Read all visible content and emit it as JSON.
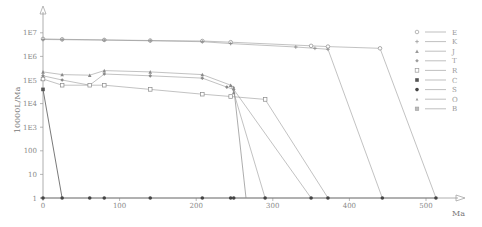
{
  "chart_data": {
    "type": "line",
    "title": "",
    "xlabel": "Ma",
    "ylabel": "10000L/Ma",
    "xscale": "linear",
    "yscale": "log",
    "xlim": [
      0,
      540
    ],
    "ylim": [
      1,
      20000000
    ],
    "x_ticks": [
      0,
      100,
      200,
      300,
      400,
      500
    ],
    "x_tick_labels": [
      "0",
      "100",
      "200",
      "300",
      "400",
      "500"
    ],
    "y_ticks": [
      1,
      10,
      100,
      1000,
      10000,
      100000,
      1000000,
      10000000
    ],
    "y_tick_labels": [
      "1",
      "10",
      "100",
      "1E3",
      "1E4",
      "1E5",
      "1E6",
      "1E7"
    ],
    "grid": false,
    "legend_position": "right",
    "series": [
      {
        "name": "E",
        "marker": "circle-open",
        "color": "#8a8a8a",
        "points": [
          [
            0,
            5500000
          ],
          [
            25,
            5300000
          ],
          [
            80,
            5000000
          ],
          [
            140,
            4700000
          ],
          [
            208,
            4500000
          ],
          [
            245,
            4000000
          ],
          [
            350,
            2800000
          ],
          [
            372,
            2600000
          ],
          [
            440,
            2200000
          ],
          [
            513,
            1
          ]
        ]
      },
      {
        "name": "K",
        "marker": "plus",
        "color": "#8a8a8a",
        "points": [
          [
            0,
            5200000
          ],
          [
            25,
            5100000
          ],
          [
            80,
            4900000
          ],
          [
            140,
            4600000
          ],
          [
            208,
            4200000
          ],
          [
            245,
            3500000
          ],
          [
            330,
            2500000
          ],
          [
            355,
            2200000
          ],
          [
            372,
            2000000
          ],
          [
            443,
            1
          ]
        ]
      },
      {
        "name": "J",
        "marker": "triangle",
        "color": "#8a8a8a",
        "points": [
          [
            0,
            220000
          ],
          [
            25,
            170000
          ],
          [
            61,
            160000
          ],
          [
            80,
            250000
          ],
          [
            140,
            220000
          ],
          [
            208,
            170000
          ],
          [
            245,
            60000
          ],
          [
            249,
            30000
          ],
          [
            290,
            1
          ]
        ]
      },
      {
        "name": "T",
        "marker": "diamond",
        "color": "#8a8a8a",
        "points": [
          [
            0,
            150000
          ],
          [
            25,
            100000
          ],
          [
            61,
            60000
          ],
          [
            80,
            180000
          ],
          [
            140,
            150000
          ],
          [
            208,
            120000
          ],
          [
            240,
            50000
          ],
          [
            249,
            40000
          ],
          [
            350,
            1
          ]
        ]
      },
      {
        "name": "R",
        "marker": "square-open",
        "color": "#8a8a8a",
        "points": [
          [
            0,
            110000
          ],
          [
            25,
            60000
          ],
          [
            61,
            60000
          ],
          [
            80,
            60000
          ],
          [
            140,
            40000
          ],
          [
            208,
            25000
          ],
          [
            245,
            20000
          ],
          [
            290,
            15000
          ],
          [
            372,
            1
          ]
        ]
      },
      {
        "name": "C",
        "marker": "square-filled",
        "color": "#6a6a6a",
        "points": [
          [
            0,
            40000
          ],
          [
            25,
            1
          ]
        ]
      },
      {
        "name": "S",
        "marker": "circle-filled",
        "color": "#6a6a6a",
        "points": [
          [
            0,
            1
          ],
          [
            25,
            1
          ],
          [
            61,
            1
          ],
          [
            80,
            1
          ],
          [
            140,
            1
          ],
          [
            208,
            1
          ],
          [
            245,
            1
          ],
          [
            249,
            1
          ],
          [
            290,
            1
          ],
          [
            350,
            1
          ],
          [
            372,
            1
          ],
          [
            443,
            1
          ],
          [
            513,
            1
          ]
        ]
      },
      {
        "name": "O",
        "marker": "triangle-small",
        "color": "#8a8a8a",
        "points": [
          [
            245,
            60000
          ],
          [
            249,
            50000
          ],
          [
            265,
            1
          ]
        ]
      },
      {
        "name": "B",
        "marker": "square-hatched",
        "color": "#8a8a8a",
        "points": []
      }
    ]
  },
  "legend": {
    "items": [
      {
        "label": "E",
        "symbol": "circle-open"
      },
      {
        "label": "K",
        "symbol": "plus"
      },
      {
        "label": "J",
        "symbol": "triangle"
      },
      {
        "label": "T",
        "symbol": "diamond"
      },
      {
        "label": "R",
        "symbol": "square-open"
      },
      {
        "label": "C",
        "symbol": "square-filled"
      },
      {
        "label": "S",
        "symbol": "circle-filled"
      },
      {
        "label": "O",
        "symbol": "triangle-small"
      },
      {
        "label": "B",
        "symbol": "square-hatched"
      }
    ]
  },
  "axes": {
    "x_title": "Ma",
    "y_title": "10000L/Ma"
  }
}
